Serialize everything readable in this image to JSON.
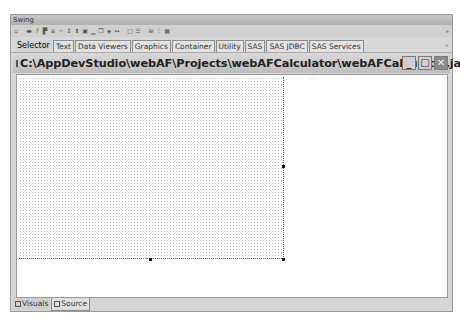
{
  "palette": {
    "title": "Swing",
    "toolbar_icons": [
      "arrow-icon",
      "label-icon",
      "help-icon",
      "tree-icon",
      "list-icon",
      "separator-icon",
      "slider-icon",
      "table-icon",
      "panel-icon",
      "chart-icon",
      "copy-icon",
      "image-icon",
      "scroll-icon",
      "box-icon",
      "align-icon",
      "grid-icon",
      "format-icon",
      "layout-icon"
    ],
    "toolbar_icon_glyphs": [
      "▫",
      "▬",
      "?",
      "▛",
      "≡",
      "─",
      "↕",
      "⬆",
      "▣",
      "▁",
      "❐",
      "◈",
      "↔",
      "□",
      "☰",
      "⊞",
      "⫶",
      "▦"
    ],
    "tabs": [
      {
        "label": "Selector",
        "selected": true
      },
      {
        "label": "Text",
        "selected": false
      },
      {
        "label": "Data Viewers",
        "selected": false
      },
      {
        "label": "Graphics",
        "selected": false
      },
      {
        "label": "Container",
        "selected": false
      },
      {
        "label": "Utility",
        "selected": false
      },
      {
        "label": "SAS",
        "selected": false
      },
      {
        "label": "SAS JDBC",
        "selected": false
      },
      {
        "label": "SAS Services",
        "selected": false
      }
    ]
  },
  "editor": {
    "title": "C:\\AppDevStudio\\webAF\\Projects\\webAFCalculator\\webAFCalculator.ja...",
    "window_buttons": {
      "minimize": "_",
      "maximize": "□",
      "close": "✕"
    },
    "bottom_tabs": [
      {
        "label": "Visuals",
        "selected": true
      },
      {
        "label": "Source",
        "selected": false
      }
    ]
  }
}
